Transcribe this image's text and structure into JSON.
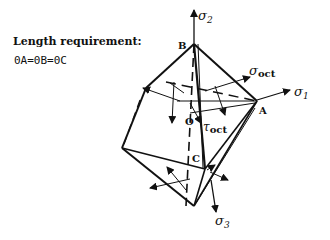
{
  "text": {
    "heading": "Length requirement:",
    "requirement": "0A=0B=0C"
  },
  "labels": {
    "sigma2": "σ",
    "sigma2_sub": "2",
    "sigma1": "σ",
    "sigma1_sub": "1",
    "sigma3": "σ",
    "sigma3_sub": "3",
    "sigma_oct": "σ",
    "sigma_oct_sub": "oct",
    "tau_oct": "τ",
    "tau_oct_sub": "oct",
    "point_A": "A",
    "point_B": "B",
    "point_C": "C",
    "point_O": "O"
  }
}
